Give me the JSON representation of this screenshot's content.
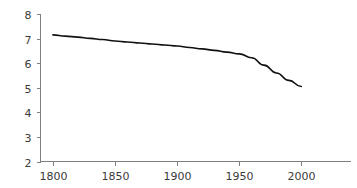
{
  "chart_data": {
    "type": "line",
    "title": "",
    "subtitle": "",
    "xlabel": "",
    "ylabel": "",
    "xlim": [
      1790,
      2040
    ],
    "ylim": [
      2,
      8
    ],
    "xticks": [
      1800,
      1850,
      1900,
      1950,
      2000
    ],
    "xtick_labels": [
      "1800",
      "1850",
      "1900",
      "1950",
      "2000"
    ],
    "yticks": [
      2,
      3,
      4,
      5,
      6,
      7,
      8
    ],
    "ytick_labels": [
      "2",
      "3",
      "4",
      "5",
      "6",
      "7",
      "8"
    ],
    "grid": false,
    "legend": false,
    "legend_position": "none",
    "series": [
      {
        "name": "series-1",
        "color": "#111111",
        "x": [
          1800,
          1810,
          1820,
          1830,
          1840,
          1850,
          1860,
          1870,
          1880,
          1890,
          1900,
          1910,
          1920,
          1930,
          1940,
          1950,
          1960,
          1970,
          1980,
          1990,
          2000
        ],
        "values": [
          7.15,
          7.1,
          7.06,
          7.01,
          6.96,
          6.9,
          6.86,
          6.82,
          6.78,
          6.74,
          6.7,
          6.64,
          6.58,
          6.52,
          6.45,
          6.38,
          6.22,
          5.92,
          5.6,
          5.3,
          5.05
        ]
      }
    ]
  },
  "axes": {
    "axis_color": "#808080",
    "tick_color": "#808080",
    "label_color": "#3a3a3a"
  },
  "canvas": {
    "background": "#ffffff"
  }
}
